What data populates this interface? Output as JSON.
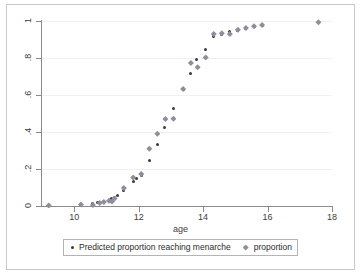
{
  "chart_data": {
    "type": "scatter",
    "title": "",
    "xlabel": "age",
    "ylabel": "",
    "xlim": [
      9,
      18
    ],
    "ylim": [
      0,
      1
    ],
    "xticks": [
      10,
      12,
      14,
      16,
      18
    ],
    "xtick_labels": [
      "10",
      "12",
      "14",
      "16",
      "18"
    ],
    "yticks": [
      0,
      0.2,
      0.4,
      0.6,
      0.8,
      1
    ],
    "ytick_labels": [
      "0",
      ".2",
      ".4",
      ".6",
      ".8",
      "1"
    ],
    "grid": "horizontal",
    "legend_position": "bottom",
    "colors": {
      "predicted": "#3a3a3a",
      "proportion": "#8e8e9c",
      "axis": "#8a8a8a",
      "gridline": "#f0f0f0",
      "frame": "#c9c9c9",
      "text": "#3c3c3c"
    },
    "series": [
      {
        "name": "Predicted proportion reaching menarche",
        "marker": "circle",
        "points": [
          [
            9.21,
            0.003
          ],
          [
            10.21,
            0.009
          ],
          [
            10.58,
            0.013
          ],
          [
            10.71,
            0.018
          ],
          [
            10.79,
            0.021
          ],
          [
            10.92,
            0.025
          ],
          [
            11.08,
            0.032
          ],
          [
            11.17,
            0.038
          ],
          [
            11.25,
            0.045
          ],
          [
            11.33,
            0.055
          ],
          [
            11.54,
            0.084
          ],
          [
            11.83,
            0.131
          ],
          [
            11.92,
            0.148
          ],
          [
            12.08,
            0.166
          ],
          [
            12.33,
            0.247
          ],
          [
            12.58,
            0.331
          ],
          [
            12.79,
            0.423
          ],
          [
            13.08,
            0.528
          ],
          [
            13.38,
            0.629
          ],
          [
            13.62,
            0.714
          ],
          [
            13.79,
            0.791
          ],
          [
            14.08,
            0.848
          ],
          [
            14.33,
            0.914
          ],
          [
            14.58,
            0.929
          ],
          [
            14.83,
            0.941
          ],
          [
            15.08,
            0.951
          ],
          [
            15.33,
            0.961
          ],
          [
            15.58,
            0.97
          ],
          [
            15.83,
            0.978
          ]
        ]
      },
      {
        "name": "proportion",
        "marker": "diamond",
        "points": [
          [
            9.21,
            0.003
          ],
          [
            10.21,
            0.008
          ],
          [
            10.58,
            0.005
          ],
          [
            10.79,
            0.016
          ],
          [
            10.92,
            0.022
          ],
          [
            11.08,
            0.028
          ],
          [
            11.17,
            0.024
          ],
          [
            11.25,
            0.04
          ],
          [
            11.54,
            0.097
          ],
          [
            11.83,
            0.154
          ],
          [
            12.08,
            0.173
          ],
          [
            12.33,
            0.31
          ],
          [
            12.58,
            0.39
          ],
          [
            12.83,
            0.47
          ],
          [
            13.08,
            0.472
          ],
          [
            13.38,
            0.632
          ],
          [
            13.62,
            0.773
          ],
          [
            13.83,
            0.75
          ],
          [
            14.08,
            0.803
          ],
          [
            14.33,
            0.93
          ],
          [
            14.58,
            0.934
          ],
          [
            14.83,
            0.93
          ],
          [
            15.08,
            0.953
          ],
          [
            15.33,
            0.962
          ],
          [
            15.58,
            0.971
          ],
          [
            15.83,
            0.978
          ],
          [
            17.58,
            0.993
          ]
        ]
      }
    ]
  },
  "legend": {
    "entries": [
      {
        "label": "Predicted proportion reaching menarche",
        "marker": "circle"
      },
      {
        "label": "proportion",
        "marker": "diamond"
      }
    ]
  }
}
